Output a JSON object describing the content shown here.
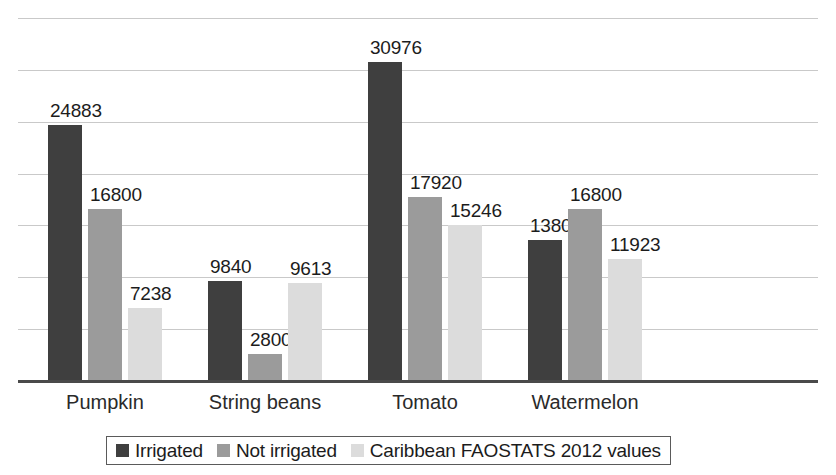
{
  "chart_data": {
    "type": "bar",
    "title": "",
    "subtitle": "",
    "xlabel": "",
    "ylabel": "",
    "ylim": [
      0,
      35000
    ],
    "grid": true,
    "gridline_values": [
      5000,
      10000,
      15000,
      20000,
      25000,
      30000,
      35000
    ],
    "legend_position": "bottom",
    "categories": [
      "Pumpkin",
      "String beans",
      "Tomato",
      "Watermelon"
    ],
    "series": [
      {
        "name": "Irrigated",
        "color": "#3f3f3f",
        "values": [
          24883,
          9840,
          30976,
          13806
        ],
        "labels": [
          "24883",
          "9840",
          "30976",
          "13806"
        ]
      },
      {
        "name": "Not irrigated",
        "color": "#9b9b9b",
        "values": [
          16800,
          2800,
          17920,
          16800
        ],
        "labels": [
          "16800",
          "2800",
          "17920",
          "16800"
        ]
      },
      {
        "name": "Caribbean FAOSTATS 2012 values",
        "color": "#dcdcdc",
        "values": [
          7238,
          9613,
          15246,
          11923
        ],
        "labels": [
          "7238",
          "9613",
          "15246",
          "11923"
        ]
      }
    ]
  },
  "legend": {
    "items": [
      {
        "label": "Irrigated",
        "color": "#3f3f3f"
      },
      {
        "label": "Not irrigated",
        "color": "#9b9b9b"
      },
      {
        "label": "Caribbean FAOSTATS 2012 values",
        "color": "#dcdcdc"
      }
    ]
  },
  "axis": {
    "baseline_color": "#4a4a4a",
    "gridline_color": "#c9c9c9"
  }
}
